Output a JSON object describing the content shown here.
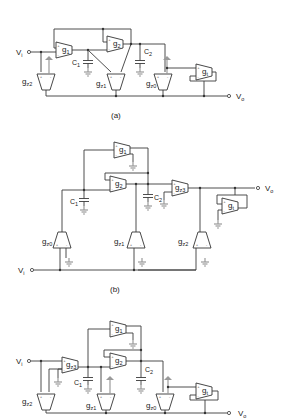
{
  "figure": {
    "panels": [
      {
        "id": "a",
        "caption": "(a)",
        "input_label": "V",
        "input_sub": "i",
        "output_label": "V",
        "output_sub": "o",
        "otas": [
          "g1",
          "g2",
          "gz2",
          "gz1",
          "gz0",
          "gt"
        ],
        "capacitors": [
          "C1",
          "C2"
        ]
      },
      {
        "id": "b",
        "caption": "(b)",
        "input_label": "V",
        "input_sub": "i",
        "output_label": "V",
        "output_sub": "o",
        "otas": [
          "g1",
          "g2",
          "gz3",
          "gt",
          "gz0",
          "gz1",
          "gz2"
        ],
        "capacitors": [
          "C1",
          "C2"
        ]
      },
      {
        "id": "c",
        "caption": "(c)",
        "input_label": "V",
        "input_sub": "i",
        "output_label": "V",
        "output_sub": "o",
        "otas": [
          "g1",
          "gz3",
          "g2",
          "gz2",
          "gz1",
          "gz0",
          "gt"
        ],
        "capacitors": [
          "C1",
          "C2"
        ]
      }
    ]
  },
  "labels": {
    "g": "g",
    "s1": "1",
    "s2": "2",
    "sz0": "z0",
    "sz1": "z1",
    "sz2": "z2",
    "sz3": "z3",
    "st": "t",
    "C": "C"
  }
}
